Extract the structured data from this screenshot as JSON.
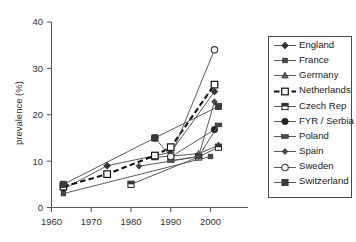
{
  "chart_data": {
    "type": "line",
    "title": "",
    "xlabel": "",
    "ylabel": "prevalence (%)",
    "xlim": [
      1958,
      2006
    ],
    "ylim": [
      0,
      40
    ],
    "xticks": [
      1960,
      1970,
      1980,
      1990,
      2000
    ],
    "yticks": [
      0,
      10,
      20,
      30,
      40
    ],
    "grid": false,
    "legend_position": "right-outside",
    "series": [
      {
        "name": "England",
        "marker": "filled-diamond",
        "linestyle": "solid",
        "x": [
          1963,
          1974,
          1990,
          2001
        ],
        "y": [
          4.0,
          9.0,
          11.9,
          25.0
        ]
      },
      {
        "name": "France",
        "marker": "filled-square-small",
        "linestyle": "solid",
        "x": [
          1963,
          2000
        ],
        "y": [
          3.0,
          11.0
        ]
      },
      {
        "name": "Germany",
        "marker": "filled-triangle",
        "linestyle": "solid",
        "x": [
          1986,
          1997,
          2002
        ],
        "y": [
          10.8,
          11.6,
          13.4
        ]
      },
      {
        "name": "Netherlands",
        "marker": "open-square",
        "linestyle": "dashed",
        "x": [
          1963,
          1974,
          1986,
          1990,
          2001
        ],
        "y": [
          4.5,
          7.2,
          11.2,
          13.0,
          26.5
        ]
      },
      {
        "name": "Czech Rep",
        "marker": "half-filled-square",
        "linestyle": "solid",
        "x": [
          1980,
          1997,
          2002
        ],
        "y": [
          5.0,
          10.9,
          13.0
        ]
      },
      {
        "name": "FYR / Serbia",
        "marker": "filled-circle",
        "linestyle": "solid",
        "x": [
          1990,
          2001
        ],
        "y": [
          10.9,
          16.8
        ]
      },
      {
        "name": "Poland",
        "marker": "filled-bar",
        "linestyle": "solid",
        "x": [
          1990,
          1997,
          2002
        ],
        "y": [
          10.1,
          11.0,
          17.8
        ]
      },
      {
        "name": "Spain",
        "marker": "filled-diamond-small",
        "linestyle": "solid",
        "x": [
          1982,
          1997,
          2001
        ],
        "y": [
          8.9,
          11.0,
          22.8
        ]
      },
      {
        "name": "Sweden",
        "marker": "open-circle",
        "linestyle": "solid",
        "x": [
          1986,
          1990,
          2001
        ],
        "y": [
          15.0,
          11.0,
          34.0
        ]
      },
      {
        "name": "Switzerland",
        "marker": "filled-square",
        "linestyle": "solid",
        "x": [
          1963,
          1986,
          2002
        ],
        "y": [
          5.0,
          15.0,
          21.8
        ]
      }
    ]
  },
  "axes": {
    "ylabel": "prevalence (%)",
    "yticklabels": [
      "0",
      "10",
      "20",
      "30",
      "40"
    ],
    "xticklabels": [
      "1960",
      "1970",
      "1980",
      "1990",
      "2000"
    ]
  },
  "legend": {
    "items": [
      {
        "label": "England"
      },
      {
        "label": "France"
      },
      {
        "label": "Germany"
      },
      {
        "label": "Netherlands"
      },
      {
        "label": "Czech Rep"
      },
      {
        "label": "FYR / Serbia"
      },
      {
        "label": "Poland"
      },
      {
        "label": "Spain"
      },
      {
        "label": "Sweden"
      },
      {
        "label": "Switzerland"
      }
    ]
  }
}
